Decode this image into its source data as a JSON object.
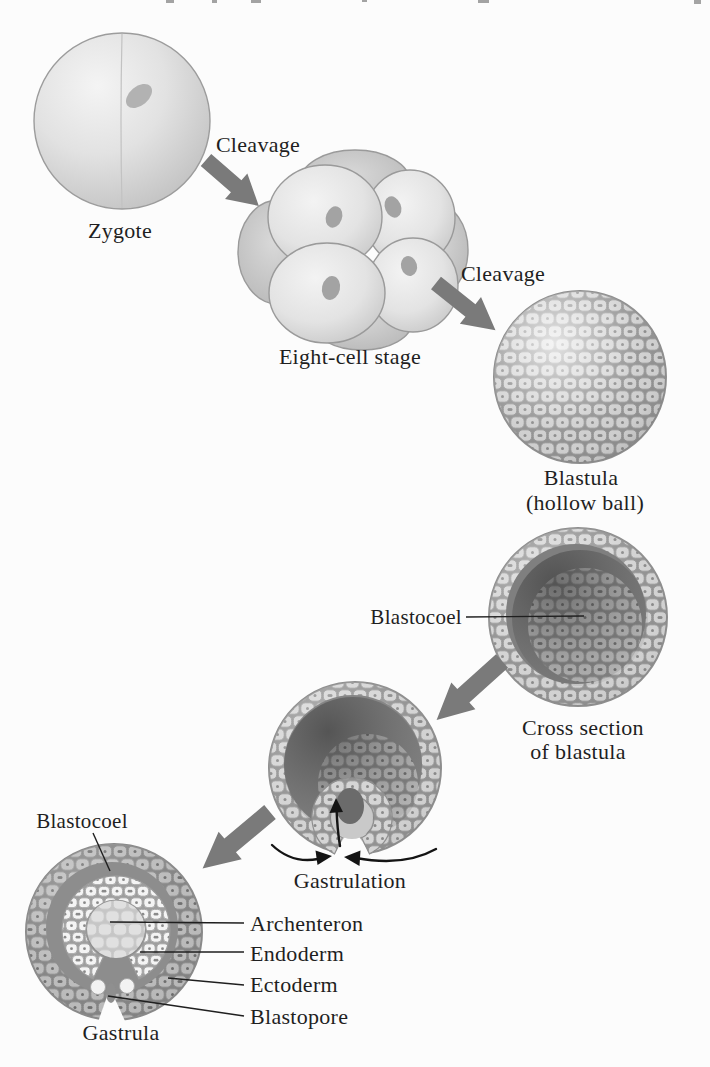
{
  "palette": {
    "page": "#fcfcfc",
    "ink": "#1f1f1f",
    "arrow": "#7a7a7a",
    "cell_light": "#d5d5d5",
    "cell_mid": "#bcbcbc",
    "cell_white": "#f4f4f4",
    "cavity_dark": "#868686",
    "blastocoel_dark": "#8d8d8d",
    "archenteron_fill": "#e0e0e0"
  },
  "stages": {
    "zygote": {
      "label": "Zygote"
    },
    "eight_cell": {
      "label": "Eight-cell stage"
    },
    "blastula": {
      "line1": "Blastula",
      "line2": "(hollow ball)"
    },
    "cross_section": {
      "line1": "Cross section",
      "line2": "of blastula"
    },
    "gastrulation": {
      "label": "Gastrulation"
    },
    "gastrula": {
      "label": "Gastrula"
    }
  },
  "processes": {
    "cleavage_1": "Cleavage",
    "cleavage_2": "Cleavage"
  },
  "annotations": {
    "blastocoel_blastula": "Blastocoel",
    "blastocoel_gastrula": "Blastocoel",
    "archenteron": "Archenteron",
    "endoderm": "Endoderm",
    "ectoderm": "Ectoderm",
    "blastopore": "Blastopore"
  }
}
